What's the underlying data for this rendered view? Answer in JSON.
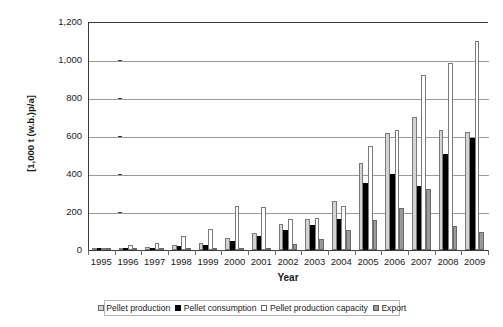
{
  "chart_data": {
    "type": "bar",
    "title": "",
    "subtitle": "",
    "xlabel": "Year",
    "ylabel": "[1,000 t (w.b.)p/a]",
    "ylim": [
      0,
      1200
    ],
    "yticks": [
      "0",
      "200",
      "400",
      "600",
      "800",
      "1,000",
      "1,200"
    ],
    "ytick_values": [
      0,
      200,
      400,
      600,
      800,
      1000,
      1200
    ],
    "grid": "horizontal",
    "legend_position": "bottom",
    "categories": [
      "1995",
      "1996",
      "1997",
      "1998",
      "1999",
      "2000",
      "2001",
      "2002",
      "2003",
      "2004",
      "2005",
      "2006",
      "2007",
      "2008",
      "2009"
    ],
    "series": [
      {
        "name": "Pellet production",
        "color": "#d3d3d3",
        "values": [
          3,
          12,
          17,
          28,
          38,
          62,
          90,
          135,
          165,
          260,
          460,
          615,
          700,
          630,
          620
        ]
      },
      {
        "name": "Pellet consumption",
        "color": "#000000",
        "values": [
          2,
          10,
          12,
          20,
          28,
          45,
          72,
          105,
          130,
          165,
          355,
          400,
          335,
          505,
          590
        ]
      },
      {
        "name": "Pellet production capacity",
        "color": "#ffffff",
        "values": [
          5,
          28,
          38,
          75,
          110,
          230,
          228,
          165,
          168,
          232,
          545,
          630,
          920,
          985,
          1100
        ]
      },
      {
        "name": "Export",
        "color": "#9a9a9a",
        "values": [
          1,
          2,
          3,
          4,
          6,
          8,
          10,
          32,
          60,
          105,
          160,
          220,
          320,
          125,
          95
        ]
      }
    ]
  },
  "legend": {
    "items": [
      {
        "label": "Pellet production",
        "swatch": "light-gray-square"
      },
      {
        "label": "Pellet consumption",
        "swatch": "black-square"
      },
      {
        "label": "Pellet production capacity",
        "swatch": "white-square"
      },
      {
        "label": "Export",
        "swatch": "gray-square"
      }
    ]
  }
}
